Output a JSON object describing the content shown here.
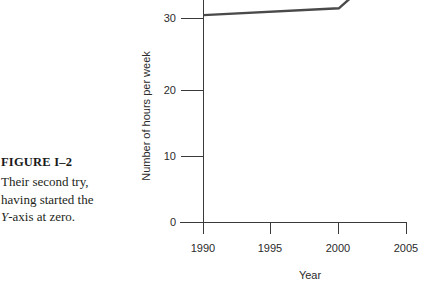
{
  "figure": {
    "label": "FIGURE I–2",
    "caption_line1": "Their second try,",
    "caption_line2": "having started the",
    "caption_line3_italic": "Y",
    "caption_line3_rest": "-axis at zero."
  },
  "chart_data": {
    "type": "line",
    "title": "",
    "xlabel": "Year",
    "ylabel": "Number of hours per week",
    "x": [
      1990,
      2000,
      2002
    ],
    "values": [
      30.5,
      31.5,
      35.0
    ],
    "xlim": [
      1990,
      2005
    ],
    "ylim": [
      0,
      35
    ],
    "xticks": [
      1990,
      1995,
      2000,
      2005
    ],
    "xticklabels": [
      "1990",
      "1995",
      "2000",
      "2005"
    ],
    "yticks": [
      0,
      10,
      20,
      30
    ],
    "yticklabels": [
      "0",
      "10",
      "20",
      "30"
    ],
    "grid": false,
    "legend": "none",
    "series": [
      {
        "name": "Hours per week",
        "color": "#4a4a4a",
        "points": [
          {
            "x": 1990,
            "y": 30.5
          },
          {
            "x": 2000,
            "y": 31.5
          },
          {
            "x": 2002,
            "y": 35.0
          }
        ]
      }
    ]
  },
  "colors": {
    "background": "#ffffff",
    "axis": "#3a3a3a",
    "line": "#4a4a4a",
    "text": "#231f20"
  }
}
